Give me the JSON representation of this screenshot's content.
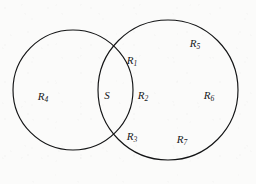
{
  "figure": {
    "type": "venn-diagram",
    "background_color": "#fbfbfa",
    "stroke_color": "#131415",
    "label_color": "#17181a"
  },
  "shapes": {
    "left_circle": {
      "name": "left-circle",
      "cx": 73,
      "cy": 90,
      "r": 60
    },
    "right_circle": {
      "name": "right-circle",
      "cx": 168,
      "cy": 90,
      "r": 70
    }
  },
  "labels": [
    {
      "id": "r1",
      "base": "R",
      "sub": "1",
      "x": 132,
      "y": 61,
      "region": "upper-lens"
    },
    {
      "id": "s",
      "base": "S",
      "sub": "",
      "x": 107,
      "y": 96,
      "region": "lens-left"
    },
    {
      "id": "r2",
      "base": "R",
      "sub": "2",
      "x": 143,
      "y": 96,
      "region": "lens-right"
    },
    {
      "id": "r3",
      "base": "R",
      "sub": "3",
      "x": 132,
      "y": 137,
      "region": "lower-lens"
    },
    {
      "id": "r4",
      "base": "R",
      "sub": "4",
      "x": 43,
      "y": 97,
      "region": "left-only"
    },
    {
      "id": "r5",
      "base": "R",
      "sub": "5",
      "x": 195,
      "y": 44,
      "region": "right-upper"
    },
    {
      "id": "r6",
      "base": "R",
      "sub": "6",
      "x": 209,
      "y": 96,
      "region": "right-middle"
    },
    {
      "id": "r7",
      "base": "R",
      "sub": "7",
      "x": 182,
      "y": 140,
      "region": "right-lower"
    }
  ]
}
